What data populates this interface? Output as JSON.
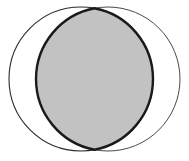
{
  "figure": {
    "title": "Two overlapping circles with shaded intersection",
    "type": "venn-diagram",
    "background_color": "#ffffff",
    "canvas": {
      "width": 189,
      "height": 161
    }
  },
  "chart_data": {
    "type": "diagram",
    "subtype": "venn-2-set",
    "title": "",
    "xlabel": "",
    "ylabel": "",
    "grid": false,
    "legend": "none",
    "shapes": [
      {
        "name": "left-circle",
        "kind": "circle",
        "cx": 81,
        "cy": 79,
        "r": 72,
        "fill": "none",
        "stroke": "#2b2b2b",
        "stroke_width": 1.1,
        "label": ""
      },
      {
        "name": "right-circle",
        "kind": "circle",
        "cx": 108,
        "cy": 79,
        "r": 72,
        "fill": "none",
        "stroke": "#4a4a4a",
        "stroke_width": 1.0,
        "label": ""
      },
      {
        "name": "intersection-lens",
        "kind": "lens",
        "fill": "#c2c2c2",
        "stroke": "#1a1a1a",
        "stroke_width": 2.4,
        "left_extent_x": 41,
        "right_extent_x": 150,
        "top_vertex": {
          "x": 94.5,
          "y": 7.2
        },
        "bottom_vertex": {
          "x": 94.5,
          "y": 150.8
        },
        "label": ""
      }
    ],
    "intersection_points": [
      {
        "x": 94.5,
        "y": 7.2
      },
      {
        "x": 94.5,
        "y": 150.8
      }
    ],
    "colors": {
      "shaded_fill": "#c2c2c2",
      "lens_outline": "#1a1a1a",
      "left_circle_outline": "#2b2b2b",
      "right_circle_outline": "#4a4a4a",
      "background": "#ffffff"
    },
    "annotations": []
  }
}
